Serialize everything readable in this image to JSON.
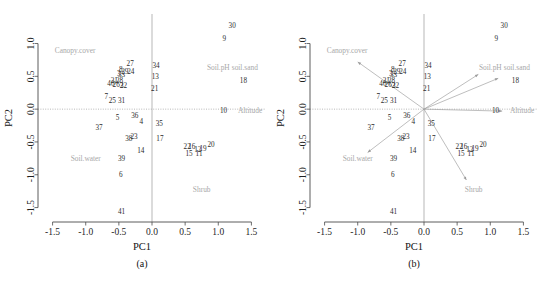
{
  "figure": {
    "panels": [
      {
        "tag": "(a)",
        "id": "a",
        "show_arrows": false
      },
      {
        "tag": "(b)",
        "id": "b",
        "show_arrows": true
      }
    ],
    "axis": {
      "xlabel": "PC1",
      "ylabel": "PC2",
      "xticks": [
        "-1.5",
        "-1.0",
        "-0.5",
        "0.0",
        "0.5",
        "1.0",
        "1.5"
      ],
      "xtick_values": [
        -1.5,
        -1.0,
        -0.5,
        0.0,
        0.5,
        1.0,
        1.5
      ],
      "yticks": [
        "-1.5",
        "-1.0",
        "-0.5",
        "0.0",
        "0.5",
        "1.0"
      ],
      "ytick_values": [
        -1.5,
        -1.0,
        -0.5,
        0.0,
        0.5,
        1.0
      ],
      "xlim": [
        -1.72,
        1.72
      ],
      "ylim": [
        -1.72,
        1.45
      ]
    },
    "colors": {
      "point_label": "#2b2b2b",
      "variable_label": "#a8a8a8",
      "arrow": "#9b9b9b",
      "axis": "#4a4a4a",
      "zero_line": "#9a9a9a",
      "background": "#ffffff"
    }
  },
  "chart_data": {
    "type": "scatter",
    "title": "",
    "xlabel": "PC1",
    "ylabel": "PC2",
    "xlim": [
      -1.72,
      1.72
    ],
    "ylim": [
      -1.72,
      1.45
    ],
    "grid": false,
    "legend": "none",
    "points": [
      {
        "label": "30",
        "x": 1.21,
        "y": 1.27
      },
      {
        "label": "9",
        "x": 1.09,
        "y": 1.07
      },
      {
        "label": "27",
        "x": -0.33,
        "y": 0.69
      },
      {
        "label": "34",
        "x": 0.06,
        "y": 0.66
      },
      {
        "label": "8",
        "x": -0.47,
        "y": 0.6
      },
      {
        "label": "29",
        "x": -0.41,
        "y": 0.56
      },
      {
        "label": "24",
        "x": -0.32,
        "y": 0.56
      },
      {
        "label": "3",
        "x": -0.5,
        "y": 0.54
      },
      {
        "label": "33",
        "x": -0.46,
        "y": 0.52
      },
      {
        "label": "13",
        "x": 0.05,
        "y": 0.49
      },
      {
        "label": "18",
        "x": 1.38,
        "y": 0.43
      },
      {
        "label": "21",
        "x": -0.57,
        "y": 0.43
      },
      {
        "label": "28",
        "x": -0.49,
        "y": 0.43
      },
      {
        "label": "40",
        "x": -0.62,
        "y": 0.38
      },
      {
        "label": "26",
        "x": -0.54,
        "y": 0.37
      },
      {
        "label": "32",
        "x": -0.43,
        "y": 0.36
      },
      {
        "label": "2",
        "x": -0.46,
        "y": 0.35
      },
      {
        "label": "21",
        "x": 0.04,
        "y": 0.3
      },
      {
        "label": "7",
        "x": -0.69,
        "y": 0.18
      },
      {
        "label": "25",
        "x": -0.6,
        "y": 0.12
      },
      {
        "label": "31",
        "x": -0.46,
        "y": 0.13
      },
      {
        "label": "10",
        "x": 1.08,
        "y": -0.03
      },
      {
        "label": "36",
        "x": -0.26,
        "y": -0.11
      },
      {
        "label": "5",
        "x": -0.52,
        "y": -0.13
      },
      {
        "label": "4",
        "x": -0.16,
        "y": -0.19
      },
      {
        "label": "35",
        "x": 0.11,
        "y": -0.22
      },
      {
        "label": "37",
        "x": -0.8,
        "y": -0.28
      },
      {
        "label": "23",
        "x": -0.27,
        "y": -0.43
      },
      {
        "label": "38",
        "x": -0.35,
        "y": -0.45
      },
      {
        "label": "17",
        "x": 0.12,
        "y": -0.45
      },
      {
        "label": "20",
        "x": 0.89,
        "y": -0.55
      },
      {
        "label": "22",
        "x": 0.53,
        "y": -0.58
      },
      {
        "label": "16",
        "x": 0.6,
        "y": -0.58
      },
      {
        "label": "12",
        "x": 0.69,
        "y": -0.62
      },
      {
        "label": "19",
        "x": 0.77,
        "y": -0.61
      },
      {
        "label": "14",
        "x": -0.17,
        "y": -0.64
      },
      {
        "label": "15",
        "x": 0.56,
        "y": -0.68
      },
      {
        "label": "11",
        "x": 0.71,
        "y": -0.68
      },
      {
        "label": "39",
        "x": -0.46,
        "y": -0.76
      },
      {
        "label": "6",
        "x": -0.47,
        "y": -1.01
      },
      {
        "label": "41",
        "x": -0.46,
        "y": -1.57
      }
    ],
    "variables": [
      {
        "label": "Canopy.cover",
        "x": -1.0,
        "y": 0.72,
        "label_x": -1.16,
        "label_y": 0.86,
        "anchor": "middle"
      },
      {
        "label": "Soil.pH",
        "x": 0.82,
        "y": 0.53,
        "label_x": 1.0,
        "label_y": 0.6,
        "anchor": "middle"
      },
      {
        "label": "soil.sand",
        "x": 1.12,
        "y": 0.47,
        "label_x": 1.4,
        "label_y": 0.6,
        "anchor": "middle"
      },
      {
        "label": "Altitude",
        "x": 1.18,
        "y": -0.03,
        "label_x": 1.48,
        "label_y": -0.06,
        "anchor": "middle"
      },
      {
        "label": "Soil.water",
        "x": -0.85,
        "y": -0.66,
        "label_x": -1.0,
        "label_y": -0.79,
        "anchor": "middle"
      },
      {
        "label": "Shrub",
        "x": 0.64,
        "y": -1.08,
        "label_x": 0.75,
        "label_y": -1.27,
        "anchor": "middle"
      }
    ]
  }
}
